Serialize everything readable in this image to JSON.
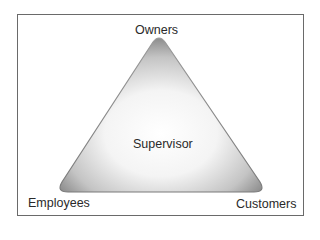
{
  "diagram": {
    "type": "triangle",
    "center_label": "Supervisor",
    "vertices": {
      "top": "Owners",
      "bottom_left": "Employees",
      "bottom_right": "Customers"
    },
    "colors": {
      "frame_border": "#6a6a6a",
      "triangle_edge": "#8a8a8a",
      "triangle_center": "#ffffff",
      "text": "#2a2a2a"
    }
  }
}
